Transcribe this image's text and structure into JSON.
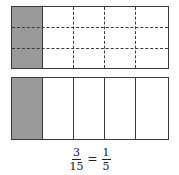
{
  "diagram": {
    "top_model": {
      "rows": 3,
      "columns": 5,
      "shaded_columns": 1,
      "grid_style": "dashed",
      "shade_color": "#9a9a9a"
    },
    "bottom_model": {
      "rows": 1,
      "columns": 5,
      "shaded_columns": 1,
      "grid_style": "solid",
      "shade_color": "#9a9a9a"
    },
    "equation": {
      "left": {
        "numerator": "3",
        "denominator": "15"
      },
      "operator": "=",
      "right": {
        "numerator": "1",
        "denominator": "5"
      }
    }
  }
}
